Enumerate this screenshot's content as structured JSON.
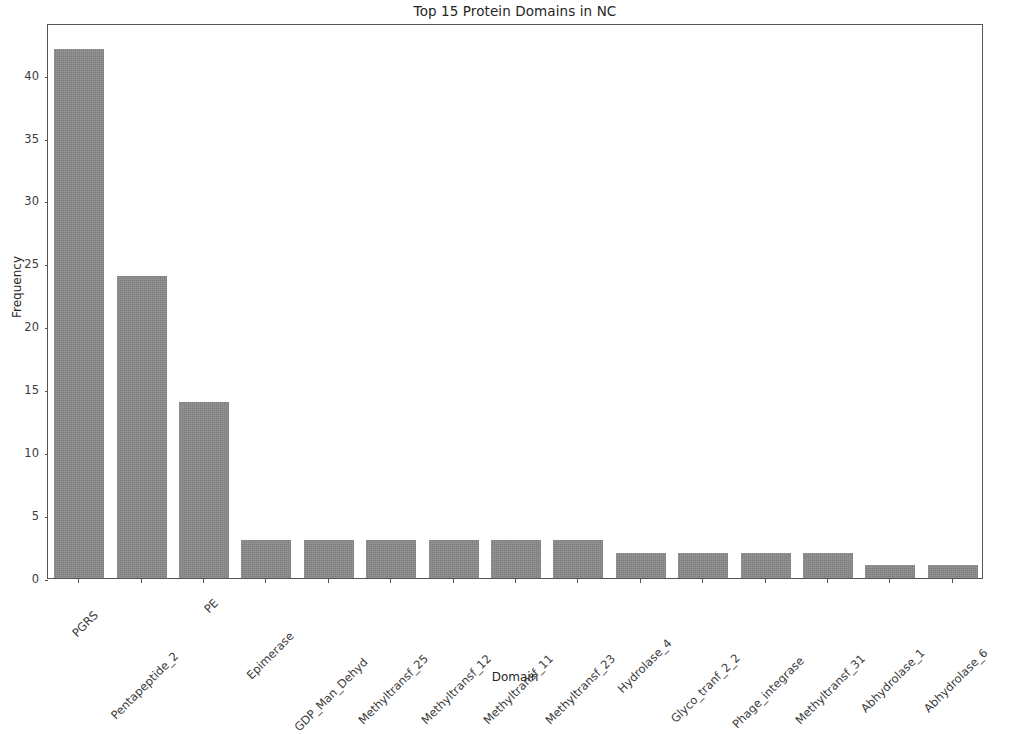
{
  "figure": {
    "background_color": "#ffffff",
    "bar_color": "#8b8b8b",
    "spine_color": "#555555",
    "text_color": "#262626"
  },
  "chart_data": {
    "type": "bar",
    "title": "Top 15 Protein Domains in NC",
    "xlabel": "Domain",
    "ylabel": "Frequency",
    "categories": [
      "PGRS",
      "Pentapeptide_2",
      "PE",
      "Epimerase",
      "GDP_Man_Dehyd",
      "Methyltransf_25",
      "Methyltransf_12",
      "Methyltransf_11",
      "Methyltransf_23",
      "Hydrolase_4",
      "Glyco_tranf_2_2",
      "Phage_integrase",
      "Methyltransf_31",
      "Abhydrolase_1",
      "Abhydrolase_6"
    ],
    "values": [
      42,
      24,
      14,
      3,
      3,
      3,
      3,
      3,
      3,
      2,
      2,
      2,
      2,
      1,
      1
    ],
    "yticks": [
      0,
      5,
      10,
      15,
      20,
      25,
      30,
      35,
      40
    ],
    "ytick_labels": [
      "0",
      "5",
      "10",
      "15",
      "20",
      "25",
      "30",
      "35",
      "40"
    ],
    "ylim": [
      0,
      44.1
    ],
    "xlim": [
      -0.5,
      14.5
    ],
    "grid": false,
    "legend": null,
    "xtick_rotation": 45
  }
}
